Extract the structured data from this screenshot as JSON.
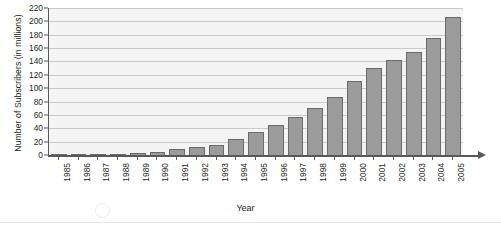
{
  "chart_data": {
    "type": "bar",
    "title": "",
    "xlabel": "Year",
    "ylabel": "Number of Subscribers (in millions)",
    "categories": [
      "1985",
      "1986",
      "1987",
      "1988",
      "1989",
      "1990",
      "1991",
      "1992",
      "1993",
      "1994",
      "1995",
      "1996",
      "1997",
      "1998",
      "1999",
      "2000",
      "2001",
      "2002",
      "2003",
      "2004",
      "2005"
    ],
    "values": [
      1,
      1,
      2,
      3,
      4,
      6,
      10,
      13,
      17,
      26,
      36,
      46,
      58,
      72,
      88,
      112,
      132,
      143,
      155,
      177,
      208
    ],
    "ylim": [
      0,
      220
    ],
    "ytick_step": 20,
    "yticks": [
      "0",
      "20",
      "40",
      "60",
      "80",
      "100",
      "120",
      "140",
      "160",
      "180",
      "200",
      "220"
    ],
    "grid": "horizontal",
    "legend": "none",
    "series_color": "#9b9b9b",
    "series_border_color": "#6a6a6a",
    "plot_background": "#f4f4f4",
    "axis_color": "#58595b"
  }
}
